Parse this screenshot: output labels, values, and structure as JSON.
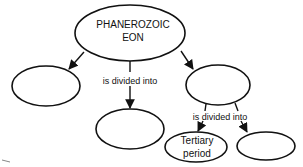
{
  "diagram": {
    "type": "concept-map",
    "nodes": [
      {
        "id": "root",
        "lines": [
          "PHANEROZOIC",
          "EON"
        ]
      },
      {
        "id": "left-blank",
        "lines": []
      },
      {
        "id": "middle-blank",
        "lines": []
      },
      {
        "id": "right-blank",
        "lines": []
      },
      {
        "id": "tertiary",
        "lines": [
          "Tertiary",
          "period"
        ]
      },
      {
        "id": "bottom-right-blank",
        "lines": []
      }
    ],
    "edges": [
      {
        "from": "root",
        "to": "left-blank",
        "label": ""
      },
      {
        "from": "root",
        "to": "middle-blank",
        "label": "is divided into"
      },
      {
        "from": "root",
        "to": "right-blank",
        "label": ""
      },
      {
        "from": "right-blank",
        "to": "tertiary",
        "label": "is divided into"
      },
      {
        "from": "right-blank",
        "to": "bottom-right-blank",
        "label": ""
      }
    ],
    "labels": {
      "root_line1": "PHANEROZOIC",
      "root_line2": "EON",
      "edge_root_children": "is divided into",
      "edge_right_children": "is divided into",
      "tertiary_line1": "Tertiary",
      "tertiary_line2": "period"
    }
  }
}
